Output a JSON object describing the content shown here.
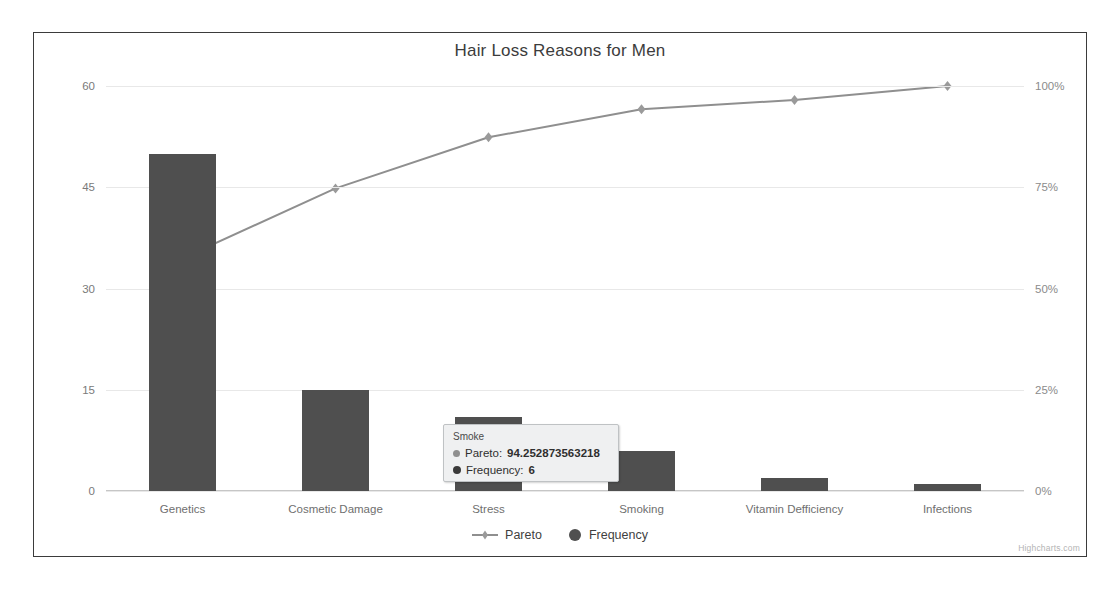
{
  "chart": {
    "title": "Hair Loss Reasons for Men",
    "credits": "Highcharts.com"
  },
  "legend": {
    "items": [
      {
        "label": "Pareto",
        "symbol": "line-marker",
        "color": "#8f8f8f"
      },
      {
        "label": "Frequency",
        "symbol": "circle-marker",
        "color": "#4f4f4f"
      }
    ]
  },
  "tooltip": {
    "header": "Smoke",
    "rows": [
      {
        "name": "Pareto:",
        "value": "94.252873563218",
        "color": "#8f8f8f"
      },
      {
        "name": "Frequency:",
        "value": "6",
        "color": "#3a3a3a"
      }
    ]
  },
  "chart_data": {
    "type": "bar",
    "title": "Hair Loss Reasons for Men",
    "xlabel": "",
    "ylabel": "",
    "categories": [
      "Genetics",
      "Cosmetic Damage",
      "Stress",
      "Smoking",
      "Vitamin Defficiency",
      "Infections"
    ],
    "series": [
      {
        "name": "Frequency",
        "type": "column",
        "axis": "left",
        "color": "#4f4f4f",
        "values": [
          50,
          15,
          11,
          6,
          2,
          1
        ]
      },
      {
        "name": "Pareto",
        "type": "line",
        "axis": "right",
        "color": "#8f8f8f",
        "values": [
          57.47126436781609,
          74.71264367816092,
          87.35632183908046,
          94.252873563218,
          96.55172413793103,
          100
        ]
      }
    ],
    "yaxis_left": {
      "ticks": [
        "0",
        "15",
        "30",
        "45",
        "60"
      ],
      "min": 0,
      "max": 60
    },
    "yaxis_right": {
      "ticks": [
        "0%",
        "25%",
        "50%",
        "75%",
        "100%"
      ],
      "min": 0,
      "max": 100
    },
    "grid": true,
    "legend_position": "bottom"
  }
}
